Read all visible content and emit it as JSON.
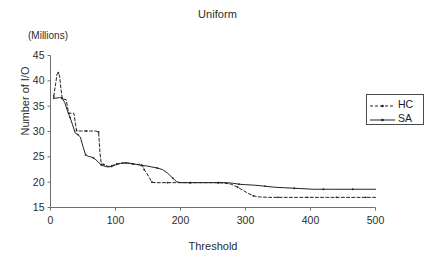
{
  "chart_data": {
    "type": "line",
    "title": "Uniform",
    "units_note": "(Millions)",
    "xlabel": "Threshold",
    "ylabel": "Number of I/O",
    "xlim": [
      0,
      500
    ],
    "ylim": [
      15,
      45
    ],
    "xticks": [
      0,
      100,
      200,
      300,
      400,
      500
    ],
    "yticks": [
      15,
      20,
      25,
      30,
      35,
      40,
      45
    ],
    "grid": false,
    "legend_position": "right",
    "series": [
      {
        "name": "HC",
        "style": "dashed",
        "marker": "dot",
        "color": "#222222",
        "points": [
          [
            5,
            37.0
          ],
          [
            8,
            39.5
          ],
          [
            10,
            41.3
          ],
          [
            12,
            41.6
          ],
          [
            14,
            41.0
          ],
          [
            16,
            38.5
          ],
          [
            18,
            36.5
          ],
          [
            20,
            36.4
          ],
          [
            24,
            36.3
          ],
          [
            28,
            33.6
          ],
          [
            32,
            33.6
          ],
          [
            36,
            33.6
          ],
          [
            40,
            30.2
          ],
          [
            44,
            30.1
          ],
          [
            48,
            30.1
          ],
          [
            55,
            30.1
          ],
          [
            62,
            30.1
          ],
          [
            70,
            30.1
          ],
          [
            74,
            29.9
          ],
          [
            76,
            26.0
          ],
          [
            78,
            23.6
          ],
          [
            82,
            23.5
          ],
          [
            88,
            23.1
          ],
          [
            95,
            23.3
          ],
          [
            102,
            23.6
          ],
          [
            110,
            23.8
          ],
          [
            118,
            23.8
          ],
          [
            126,
            23.6
          ],
          [
            134,
            23.5
          ],
          [
            140,
            23.6
          ],
          [
            144,
            22.5
          ],
          [
            148,
            21.8
          ],
          [
            152,
            20.9
          ],
          [
            156,
            20.0
          ],
          [
            162,
            19.9
          ],
          [
            170,
            19.9
          ],
          [
            180,
            19.9
          ],
          [
            190,
            19.9
          ],
          [
            200,
            19.9
          ],
          [
            215,
            19.9
          ],
          [
            230,
            19.9
          ],
          [
            245,
            19.9
          ],
          [
            258,
            19.9
          ],
          [
            268,
            19.8
          ],
          [
            278,
            19.6
          ],
          [
            288,
            19.0
          ],
          [
            296,
            18.4
          ],
          [
            304,
            17.8
          ],
          [
            312,
            17.3
          ],
          [
            320,
            17.1
          ],
          [
            335,
            17.0
          ],
          [
            350,
            17.0
          ],
          [
            365,
            17.0
          ],
          [
            380,
            17.0
          ],
          [
            395,
            17.0
          ],
          [
            410,
            17.0
          ],
          [
            425,
            17.0
          ],
          [
            440,
            17.0
          ],
          [
            455,
            17.0
          ],
          [
            470,
            17.0
          ],
          [
            485,
            17.0
          ],
          [
            500,
            17.0
          ]
        ]
      },
      {
        "name": "SA",
        "style": "solid",
        "marker": "dot",
        "color": "#222222",
        "points": [
          [
            5,
            36.6
          ],
          [
            10,
            36.6
          ],
          [
            14,
            36.7
          ],
          [
            18,
            36.6
          ],
          [
            22,
            35.7
          ],
          [
            26,
            34.1
          ],
          [
            30,
            32.8
          ],
          [
            34,
            31.3
          ],
          [
            38,
            29.7
          ],
          [
            42,
            29.4
          ],
          [
            46,
            28.9
          ],
          [
            50,
            27.0
          ],
          [
            54,
            25.4
          ],
          [
            58,
            25.1
          ],
          [
            62,
            25.0
          ],
          [
            66,
            24.8
          ],
          [
            70,
            24.4
          ],
          [
            74,
            23.9
          ],
          [
            78,
            23.4
          ],
          [
            82,
            23.2
          ],
          [
            88,
            23.0
          ],
          [
            94,
            23.1
          ],
          [
            100,
            23.4
          ],
          [
            108,
            23.7
          ],
          [
            116,
            23.8
          ],
          [
            124,
            23.7
          ],
          [
            132,
            23.5
          ],
          [
            140,
            23.3
          ],
          [
            148,
            23.2
          ],
          [
            156,
            23.0
          ],
          [
            164,
            22.8
          ],
          [
            172,
            22.5
          ],
          [
            180,
            21.8
          ],
          [
            188,
            20.8
          ],
          [
            194,
            20.1
          ],
          [
            200,
            19.9
          ],
          [
            215,
            19.9
          ],
          [
            230,
            19.9
          ],
          [
            245,
            19.9
          ],
          [
            258,
            19.9
          ],
          [
            270,
            19.9
          ],
          [
            280,
            19.8
          ],
          [
            290,
            19.6
          ],
          [
            300,
            19.5
          ],
          [
            315,
            19.4
          ],
          [
            330,
            19.2
          ],
          [
            345,
            19.0
          ],
          [
            360,
            18.9
          ],
          [
            375,
            18.8
          ],
          [
            390,
            18.7
          ],
          [
            405,
            18.6
          ],
          [
            420,
            18.6
          ],
          [
            435,
            18.6
          ],
          [
            450,
            18.6
          ],
          [
            465,
            18.6
          ],
          [
            480,
            18.6
          ],
          [
            500,
            18.6
          ]
        ]
      }
    ]
  },
  "legend": {
    "items": [
      {
        "label": "HC"
      },
      {
        "label": "SA"
      }
    ]
  },
  "axes": {
    "x_tick_labels": [
      "0",
      "100",
      "200",
      "300",
      "400",
      "500"
    ],
    "y_tick_labels": [
      "45",
      "40",
      "35",
      "30",
      "25",
      "20",
      "15"
    ]
  }
}
